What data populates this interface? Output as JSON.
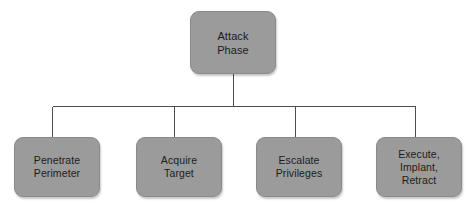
{
  "diagram": {
    "type": "organization-chart",
    "background_color": "#ffffff",
    "node_fill_color": "#9b9b9b",
    "node_border_color": "#8a8a8a",
    "node_text_color": "#1c1c1c",
    "connector_color": "#4d4d4d",
    "root": {
      "id": "attack-phase",
      "label": "Attack\nPhase",
      "x": 190,
      "y": 11,
      "width": 86,
      "height": 63
    },
    "children": [
      {
        "id": "penetrate-perimeter",
        "label": "Penetrate\nPerimeter",
        "x": 14,
        "y": 137,
        "width": 86,
        "height": 60,
        "connector_x": 52
      },
      {
        "id": "acquire-target",
        "label": "Acquire\nTarget",
        "x": 136,
        "y": 137,
        "width": 86,
        "height": 60,
        "connector_x": 174
      },
      {
        "id": "escalate-privileges",
        "label": "Escalate\nPrivileges",
        "x": 256,
        "y": 137,
        "width": 86,
        "height": 60,
        "connector_x": 295
      },
      {
        "id": "execute-implant-retract",
        "label": "Execute,\nImplant,\nRetract",
        "x": 376,
        "y": 137,
        "width": 86,
        "height": 60,
        "connector_x": 415
      }
    ],
    "connectors": {
      "stem_x": 233,
      "stem_top_y": 74,
      "bus_y": 106,
      "bus_left_x": 52,
      "bus_right_x": 415,
      "drop_bottom_y": 137,
      "line_width": 1
    }
  }
}
